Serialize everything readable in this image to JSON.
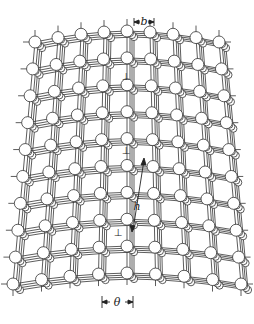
{
  "figure": {
    "type": "crystal-lattice-tilt-boundary",
    "labels": {
      "burgers_vector": "b",
      "spacing": "h",
      "tilt_angle": "θ"
    },
    "dislocation_symbol": "⊥",
    "dislocations": [
      {
        "x": 126,
        "y": 76
      },
      {
        "x": 126,
        "y": 150
      },
      {
        "x": 118,
        "y": 232
      }
    ],
    "colors": {
      "line": "#333333",
      "atom_fill": "#ffffff",
      "atom_stroke": "#333333",
      "background": "#ffffff"
    }
  }
}
